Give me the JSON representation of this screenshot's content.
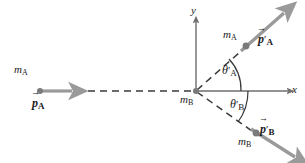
{
  "figure": {
    "background_color": "#ffffff",
    "axis_color": "#6e6e6e",
    "dash_color": "#3a3a3a",
    "vector_color": "#9a9a9a",
    "dot_color": "#7a7a7a",
    "arc_color": "#3a3a3a"
  },
  "axes": {
    "x_label": "x",
    "y_label": "y",
    "origin": {
      "x": 196,
      "y": 91
    }
  },
  "particles": [
    {
      "id": "incoming-a",
      "mass_symbol": "m",
      "mass_subscript": "A",
      "label_x": 14,
      "label_y": 64,
      "dot": {
        "x": 40,
        "y": 91
      }
    },
    {
      "id": "target-b",
      "mass_symbol": "m",
      "mass_subscript": "B",
      "label_x": 182,
      "label_y": 94,
      "dot": {
        "x": 196,
        "y": 91
      }
    },
    {
      "id": "outgoing-a",
      "mass_symbol": "m",
      "mass_subscript": "A",
      "label_x": 225,
      "label_y": 29,
      "dot": {
        "x": 246,
        "y": 46
      }
    },
    {
      "id": "outgoing-b",
      "mass_symbol": "m",
      "mass_subscript": "B",
      "label_x": 240,
      "label_y": 138,
      "dot": {
        "x": 256,
        "y": 133
      }
    }
  ],
  "momentum_vectors": [
    {
      "id": "p-a",
      "symbol": "p",
      "prime": "",
      "subscript": "A",
      "label_x": 33,
      "label_y": 98,
      "from": {
        "x": 40,
        "y": 91
      },
      "to": {
        "x": 70,
        "y": 91
      }
    },
    {
      "id": "p-a-prime",
      "symbol": "p",
      "prime": "′",
      "subscript": "A",
      "label_x": 259,
      "label_y": 34,
      "from": {
        "x": 241,
        "y": 51
      },
      "to": {
        "x": 286,
        "y": 11
      }
    },
    {
      "id": "p-b-prime",
      "symbol": "p",
      "prime": "′",
      "subscript": "B",
      "label_x": 261,
      "label_y": 125,
      "from": {
        "x": 251,
        "y": 129
      },
      "to": {
        "x": 297,
        "y": 158
      }
    }
  ],
  "angles": [
    {
      "id": "theta-a-prime",
      "symbol": "θ",
      "prime": "′",
      "subscript": "A",
      "label_x": 224,
      "label_y": 66,
      "value_deg": 42,
      "direction": "above-x-axis"
    },
    {
      "id": "theta-b-prime",
      "symbol": "θ",
      "prime": "′",
      "subscript": "B",
      "label_x": 231,
      "label_y": 100,
      "value_deg": 35,
      "direction": "below-x-axis"
    }
  ],
  "dashed_paths": [
    {
      "id": "incoming-path",
      "from": {
        "x": 40,
        "y": 91
      },
      "to": {
        "x": 196,
        "y": 91
      }
    },
    {
      "id": "outgoing-a-path",
      "from": {
        "x": 196,
        "y": 91
      },
      "to": {
        "x": 247,
        "y": 46
      }
    },
    {
      "id": "outgoing-b-path",
      "from": {
        "x": 196,
        "y": 91
      },
      "to": {
        "x": 257,
        "y": 134
      }
    }
  ]
}
